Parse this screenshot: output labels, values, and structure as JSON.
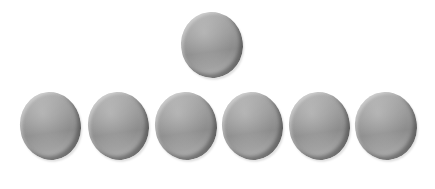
{
  "diagram": {
    "color": "#9a9a9a",
    "top_row": [
      {
        "id": "disc-top",
        "left": 181,
        "top": 12,
        "width": 62,
        "height": 66
      }
    ],
    "bottom_row": [
      {
        "id": "disc-1",
        "left": 20,
        "top": 92,
        "width": 61,
        "height": 68
      },
      {
        "id": "disc-2",
        "left": 88,
        "top": 92,
        "width": 61,
        "height": 68
      },
      {
        "id": "disc-3",
        "left": 155,
        "top": 92,
        "width": 62,
        "height": 68
      },
      {
        "id": "disc-4",
        "left": 222,
        "top": 92,
        "width": 61,
        "height": 68
      },
      {
        "id": "disc-5",
        "left": 289,
        "top": 92,
        "width": 61,
        "height": 68
      },
      {
        "id": "disc-6",
        "left": 355,
        "top": 92,
        "width": 62,
        "height": 68
      }
    ]
  }
}
